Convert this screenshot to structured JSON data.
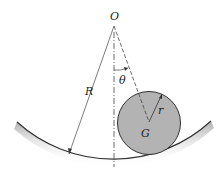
{
  "diagram": {
    "labels": {
      "origin": "O",
      "big_radius": "R",
      "angle": "θ",
      "small_radius": "r",
      "center_of_mass": "G"
    },
    "colors": {
      "disk_fill": "#b3b3b3",
      "line": "#333333",
      "surface_shadow": "#9a9a9a"
    }
  }
}
